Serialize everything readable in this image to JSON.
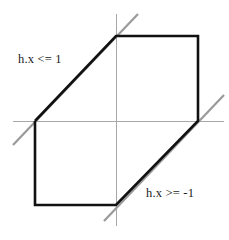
{
  "figure": {
    "title": "",
    "width": 229,
    "height": 240,
    "background_color": "#ffffff"
  },
  "labels": {
    "upper_constraint": "h.x <= 1",
    "lower_constraint": "h.x >= -1"
  },
  "colors": {
    "axis": "#a8a8a8",
    "constraint_line": "#9a9a9a",
    "region_outline": "#111111",
    "label_text": "#1a1a1a"
  },
  "chart_data": {
    "type": "line",
    "title": "",
    "xlabel": "",
    "ylabel": "",
    "grid": false,
    "legend": "none",
    "axes": {
      "origin": [
        116,
        121
      ],
      "x_axis": {
        "from": [
          13,
          121
        ],
        "to": [
          224,
          121
        ],
        "color": "#a8a8a8",
        "width": 1
      },
      "y_axis": {
        "from": [
          116,
          14
        ],
        "to": [
          116,
          226
        ],
        "color": "#a8a8a8",
        "width": 1
      }
    },
    "series": [
      {
        "name": "h.x <= 1",
        "kind": "constraint-line",
        "color": "#9a9a9a",
        "width": 2.2,
        "points": [
          [
            13,
            145
          ],
          [
            138,
            14
          ]
        ],
        "passes_through": [
          [
            35,
            121
          ],
          [
            116,
            36
          ]
        ]
      },
      {
        "name": "h.x >= -1",
        "kind": "constraint-line",
        "color": "#9a9a9a",
        "width": 2.2,
        "points": [
          [
            104,
            221
          ],
          [
            224,
            95
          ]
        ],
        "passes_through": [
          [
            116,
            205
          ],
          [
            198,
            121
          ]
        ]
      },
      {
        "name": "feasible-region",
        "kind": "polygon-outline",
        "color": "#111111",
        "width": 2.6,
        "points": [
          [
            35,
            121
          ],
          [
            116,
            36
          ],
          [
            198,
            36
          ],
          [
            198,
            121
          ],
          [
            116,
            205
          ],
          [
            35,
            205
          ]
        ],
        "closed": false
      }
    ],
    "annotations": [
      {
        "text": "h.x <= 1",
        "x": 18,
        "y": 52,
        "anchor": "top-left"
      },
      {
        "text": "h.x >= -1",
        "x": 146,
        "y": 186,
        "anchor": "top-left"
      }
    ]
  }
}
